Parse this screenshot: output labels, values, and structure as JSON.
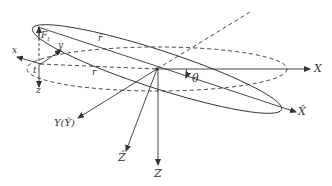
{
  "figure": {
    "type": "coordinate-frame diagram",
    "stroke_color": "#333333",
    "background": "#ffffff"
  },
  "labels": {
    "X": "X",
    "X_hat": "X̂",
    "Y_Y_hat": "Y(Ŷ)",
    "Z_hat": "Ẑ",
    "Z": "Z",
    "theta": "θ",
    "r": "r",
    "r_hat": "r̂",
    "F_t": "F",
    "F_t_sub": "t",
    "x_local": "x",
    "y_local": "y",
    "z_local": "z",
    "t_local": "t"
  },
  "elements": {
    "center": [
      157,
      69
    ],
    "orbit_reference": {
      "style": "dashed",
      "cx": 157,
      "cy": 69,
      "rx": 130,
      "ry": 22
    },
    "orbit_inclined": {
      "style": "solid",
      "cx": 157,
      "cy": 69,
      "rx": 130,
      "ry": 19,
      "rotation_deg": 18
    },
    "axes": [
      {
        "name": "X",
        "style": "solid",
        "to": [
          310,
          69
        ]
      },
      {
        "name": "X_hat",
        "style": "solid",
        "to": [
          296,
          112
        ]
      },
      {
        "name": "Y_Y_hat",
        "style": "solid",
        "to": [
          78,
          118
        ]
      },
      {
        "name": "Z_hat",
        "style": "solid",
        "to": [
          126,
          150
        ]
      },
      {
        "name": "Z",
        "style": "solid",
        "to": [
          157,
          164
        ]
      },
      {
        "name": "node_line",
        "style": "dashed",
        "to": [
          250,
          12
        ]
      }
    ],
    "local_frame_origin": [
      40,
      64
    ]
  }
}
